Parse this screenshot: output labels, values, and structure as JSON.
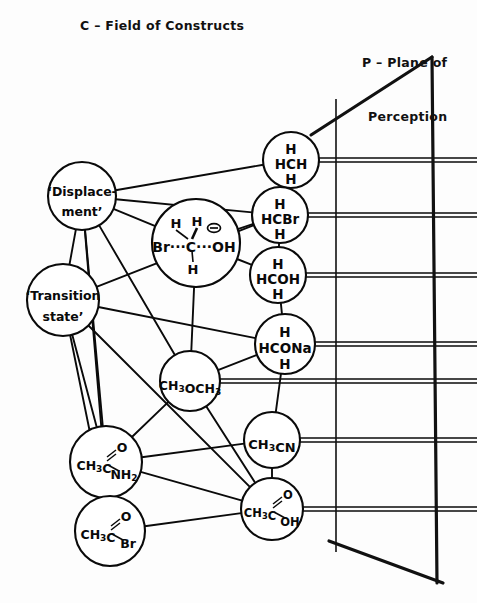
{
  "header": {
    "left": "C – Field of Constructs",
    "right_line1": "P – Plane of",
    "right_line2": "Perception"
  },
  "colors": {
    "ink": "#0a0a0a",
    "background": "#fdfdfd",
    "plane_edge": "#111111"
  },
  "nodes": [
    {
      "id": "displacement",
      "name": "node-displacement",
      "cx": 82,
      "cy": 196,
      "r": 34,
      "lines": [
        {
          "text": "‘Displace-",
          "dy": -8
        },
        {
          "text": "ment’",
          "dy": 12
        }
      ],
      "font_size": 12.5,
      "kind": "construct"
    },
    {
      "id": "transition-state",
      "name": "node-transition-state",
      "cx": 63,
      "cy": 300,
      "r": 36,
      "lines": [
        {
          "text": "‘Transition",
          "dy": -8
        },
        {
          "text": "state’",
          "dy": 13
        }
      ],
      "font_size": 12.5,
      "kind": "construct"
    },
    {
      "id": "sn2-transition-complex",
      "name": "node-sn2-transition-complex",
      "cx": 196,
      "cy": 243,
      "r": 44,
      "formula": "Br···C···OH",
      "kind": "complex"
    },
    {
      "id": "methane",
      "name": "node-methane",
      "cx": 291,
      "cy": 160,
      "r": 28,
      "lines": [
        {
          "text": "H",
          "dy": -14
        },
        {
          "text": "HCH",
          "dy": 1
        },
        {
          "text": "H",
          "dy": 16
        }
      ],
      "font_size": 13.5,
      "kind": "molecule"
    },
    {
      "id": "bromomethane",
      "name": "node-bromomethane",
      "cx": 280,
      "cy": 215,
      "r": 28,
      "lines": [
        {
          "text": "H",
          "dy": -14
        },
        {
          "text": "HCBr",
          "dy": 1
        },
        {
          "text": "H",
          "dy": 16
        }
      ],
      "font_size": 13.5,
      "kind": "molecule"
    },
    {
      "id": "methanol",
      "name": "node-methanol",
      "cx": 278,
      "cy": 275,
      "r": 28,
      "lines": [
        {
          "text": "H",
          "dy": -14
        },
        {
          "text": "HCOH",
          "dy": 1
        },
        {
          "text": "H",
          "dy": 16
        }
      ],
      "font_size": 13.5,
      "kind": "molecule"
    },
    {
      "id": "sodium-methoxide",
      "name": "node-sodium-methoxide",
      "cx": 285,
      "cy": 344,
      "r": 30,
      "lines": [
        {
          "text": "H",
          "dy": -15
        },
        {
          "text": "HCONa",
          "dy": 1
        },
        {
          "text": "H",
          "dy": 17
        }
      ],
      "font_size": 13.5,
      "kind": "molecule"
    },
    {
      "id": "dimethyl-ether",
      "name": "node-dimethyl-ether",
      "cx": 190,
      "cy": 381,
      "r": 30,
      "formula_parts": [
        {
          "t": "CH",
          "sub": false
        },
        {
          "t": "3",
          "sub": true
        },
        {
          "t": "OCH",
          "sub": false
        },
        {
          "t": "3",
          "sub": true
        }
      ],
      "font_size": 12.5,
      "kind": "molecule"
    },
    {
      "id": "acetonitrile",
      "name": "node-acetonitrile",
      "cx": 272,
      "cy": 440,
      "r": 28,
      "formula_parts": [
        {
          "t": "CH",
          "sub": false
        },
        {
          "t": "3",
          "sub": true
        },
        {
          "t": "CN",
          "sub": false
        }
      ],
      "font_size": 13,
      "kind": "molecule"
    },
    {
      "id": "acetamide",
      "name": "node-acetamide",
      "cx": 106,
      "cy": 462,
      "r": 36,
      "kind": "acyl",
      "stem_parts": [
        {
          "t": "CH",
          "sub": false
        },
        {
          "t": "3",
          "sub": true
        },
        {
          "t": "C",
          "sub": false
        }
      ],
      "double_bond_label": "O",
      "single_bond_parts": [
        {
          "t": "NH",
          "sub": false
        },
        {
          "t": "2",
          "sub": true
        }
      ],
      "font_size": 12.5
    },
    {
      "id": "acetyl-bromide",
      "name": "node-acetyl-bromide",
      "cx": 110,
      "cy": 531,
      "r": 35,
      "kind": "acyl",
      "stem_parts": [
        {
          "t": "CH",
          "sub": false
        },
        {
          "t": "3",
          "sub": true
        },
        {
          "t": "C",
          "sub": false
        }
      ],
      "double_bond_label": "O",
      "single_bond_parts": [
        {
          "t": "Br",
          "sub": false
        }
      ],
      "font_size": 12.5
    },
    {
      "id": "acetic-acid",
      "name": "node-acetic-acid",
      "cx": 272,
      "cy": 509,
      "r": 31,
      "kind": "acyl",
      "stem_parts": [
        {
          "t": "CH",
          "sub": false
        },
        {
          "t": "3",
          "sub": true
        },
        {
          "t": "C",
          "sub": false
        }
      ],
      "double_bond_label": "O",
      "single_bond_parts": [
        {
          "t": "OH",
          "sub": false
        }
      ],
      "font_size": 11.5
    }
  ],
  "edges": [
    {
      "from": "displacement",
      "to": "methane"
    },
    {
      "from": "displacement",
      "to": "bromomethane"
    },
    {
      "from": "displacement",
      "to": "transition-state"
    },
    {
      "from": "displacement",
      "to": "sn2-transition-complex"
    },
    {
      "from": "displacement",
      "to": "dimethyl-ether"
    },
    {
      "from": "displacement",
      "to": "acetamide"
    },
    {
      "from": "displacement",
      "to": "acetyl-bromide"
    },
    {
      "from": "transition-state",
      "to": "bromomethane"
    },
    {
      "from": "transition-state",
      "to": "sodium-methoxide"
    },
    {
      "from": "transition-state",
      "to": "acetamide"
    },
    {
      "from": "transition-state",
      "to": "acetyl-bromide"
    },
    {
      "from": "transition-state",
      "to": "acetic-acid"
    },
    {
      "from": "sn2-transition-complex",
      "to": "bromomethane"
    },
    {
      "from": "sn2-transition-complex",
      "to": "methanol"
    },
    {
      "from": "sn2-transition-complex",
      "to": "dimethyl-ether"
    },
    {
      "from": "methane",
      "to": "bromomethane"
    },
    {
      "from": "bromomethane",
      "to": "methanol"
    },
    {
      "from": "methanol",
      "to": "sodium-methoxide"
    },
    {
      "from": "sodium-methoxide",
      "to": "dimethyl-ether"
    },
    {
      "from": "sodium-methoxide",
      "to": "acetonitrile"
    },
    {
      "from": "dimethyl-ether",
      "to": "acetamide"
    },
    {
      "from": "dimethyl-ether",
      "to": "acetic-acid"
    },
    {
      "from": "acetonitrile",
      "to": "acetamide"
    },
    {
      "from": "acetonitrile",
      "to": "acetic-acid"
    },
    {
      "from": "acetamide",
      "to": "acetyl-bromide"
    },
    {
      "from": "acetamide",
      "to": "acetic-acid"
    },
    {
      "from": "acetyl-bromide",
      "to": "acetic-acid"
    }
  ],
  "projection_rays": [
    {
      "name": "ray-methane",
      "from": "methane",
      "y": 160,
      "x_start": 319,
      "x_end": 477
    },
    {
      "name": "ray-bromomethane",
      "from": "bromomethane",
      "y": 215,
      "x_start": 308,
      "x_end": 477
    },
    {
      "name": "ray-methanol",
      "from": "methanol",
      "y": 275,
      "x_start": 306,
      "x_end": 477
    },
    {
      "name": "ray-sodium-methoxide",
      "from": "sodium-methoxide",
      "y": 344,
      "x_start": 315,
      "x_end": 477
    },
    {
      "name": "ray-dimethyl-ether",
      "from": "dimethyl-ether",
      "y": 381,
      "x_start": 220,
      "x_end": 477
    },
    {
      "name": "ray-acetonitrile",
      "from": "acetonitrile",
      "y": 440,
      "x_start": 300,
      "x_end": 477
    },
    {
      "name": "ray-acetic-acid",
      "from": "acetic-acid",
      "y": 509,
      "x_start": 303,
      "x_end": 477
    }
  ],
  "plane": {
    "name": "plane-of-perception",
    "top_left_x": 311,
    "top_left_y": 135,
    "top_right_x": 432,
    "top_right_y": 57,
    "bottom_right_x": 437,
    "bottom_right_y": 583,
    "bottom_left_x": 329,
    "bottom_left_y": 541,
    "inner_line_x": 336,
    "inner_line_top_y": 99,
    "inner_line_bottom_y": 552,
    "edge_width": 3.2,
    "inner_width": 1.6
  }
}
